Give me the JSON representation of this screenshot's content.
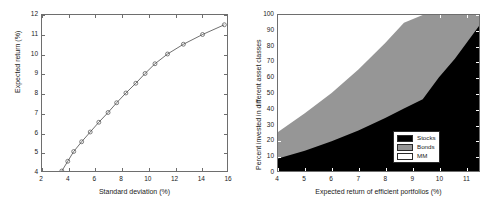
{
  "figure": {
    "background": "#ffffff",
    "axis_color": "#6e6e6e"
  },
  "chart_data": [
    {
      "id": "efficient-frontier",
      "type": "line",
      "title": "",
      "xlabel": "Standard deviation (%)",
      "ylabel": "Expected return (%)",
      "xlim": [
        2,
        16
      ],
      "ylim": [
        4,
        12
      ],
      "xticks": [
        2,
        4,
        6,
        8,
        10,
        12,
        14,
        16
      ],
      "yticks": [
        4,
        5,
        6,
        7,
        8,
        9,
        10,
        11,
        12
      ],
      "grid": false,
      "legend": null,
      "marker": "circle-open",
      "line_color": "#4a4a4a",
      "marker_color": "#4a4a4a",
      "x": [
        3.5,
        3.95,
        4.4,
        5.0,
        5.65,
        6.3,
        7.0,
        7.65,
        8.35,
        9.1,
        9.8,
        10.55,
        11.5,
        12.7,
        14.15,
        15.8
      ],
      "y": [
        4.0,
        4.5,
        5.0,
        5.5,
        6.0,
        6.5,
        7.0,
        7.5,
        8.0,
        8.5,
        9.0,
        9.5,
        10.0,
        10.5,
        11.0,
        11.5
      ]
    },
    {
      "id": "asset-allocation",
      "type": "area",
      "title": "",
      "xlabel": "Expected return of efficient portfolios (%)",
      "ylabel": "Percent invested in different asset classes",
      "xlim": [
        4,
        11.5
      ],
      "ylim": [
        0,
        100
      ],
      "xticks": [
        4,
        5,
        6,
        7,
        8,
        9,
        10,
        11
      ],
      "yticks": [
        0,
        10,
        20,
        30,
        40,
        50,
        60,
        70,
        80,
        90,
        100
      ],
      "grid": false,
      "stacked": true,
      "legend_position": "lower-right",
      "x": [
        4.0,
        5.0,
        6.0,
        7.0,
        8.0,
        8.7,
        9.4,
        10.0,
        10.6,
        11.5
      ],
      "series": [
        {
          "name": "Stocks",
          "color": "#000000",
          "values": [
            8,
            13,
            19,
            26,
            34,
            40,
            46,
            60,
            72,
            93
          ]
        },
        {
          "name": "Bonds",
          "color": "#969696",
          "values": [
            17,
            24,
            31,
            39,
            48,
            55,
            54,
            40,
            28,
            7
          ]
        },
        {
          "name": "MM",
          "color": "#ffffff",
          "values": [
            75,
            63,
            50,
            35,
            18,
            5,
            0,
            0,
            0,
            0
          ]
        }
      ],
      "boundaries": {
        "stocks_top": [
          [
            4,
            8
          ],
          [
            5,
            13
          ],
          [
            6,
            19
          ],
          [
            7,
            26
          ],
          [
            8,
            34
          ],
          [
            8.7,
            40
          ],
          [
            9.4,
            46
          ],
          [
            10,
            60
          ],
          [
            10.6,
            72
          ],
          [
            11.5,
            93
          ]
        ],
        "bonds_top": [
          [
            4,
            25
          ],
          [
            5,
            37
          ],
          [
            6,
            50
          ],
          [
            7,
            65
          ],
          [
            8,
            82
          ],
          [
            8.7,
            95
          ],
          [
            9.4,
            100
          ],
          [
            11.5,
            100
          ]
        ]
      },
      "legend": [
        {
          "label": "Stocks",
          "color": "#000000"
        },
        {
          "label": "Bonds",
          "color": "#969696"
        },
        {
          "label": "MM",
          "color": "#ffffff"
        }
      ]
    }
  ]
}
